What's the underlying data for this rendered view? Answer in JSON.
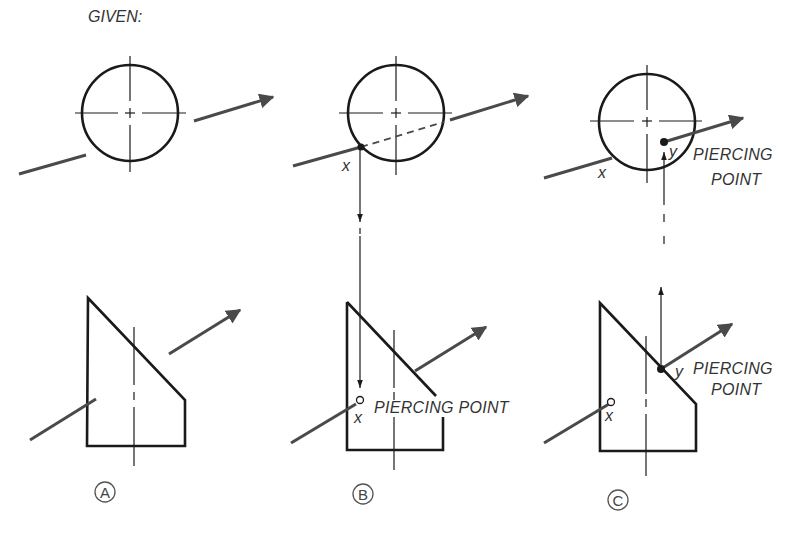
{
  "title": "GIVEN:",
  "panels": [
    {
      "id": "A",
      "label": "A",
      "point_labels": []
    },
    {
      "id": "B",
      "label": "B",
      "point_labels": [
        "x"
      ],
      "annotation": "PIERCING POINT"
    },
    {
      "id": "C",
      "label": "C",
      "point_labels": [
        "x",
        "y"
      ],
      "annotation_top_line1": "PIERCING",
      "annotation_top_line2": "POINT",
      "annotation_bottom_line1": "PIERCING",
      "annotation_bottom_line2": "POINT"
    }
  ],
  "labels": {
    "x": "x",
    "y": "y",
    "piercing": "PIERCING",
    "point": "POINT",
    "piercing_point": "PIERCING POINT"
  },
  "colors": {
    "outline": "#1a1a1a",
    "line": "#4a4a4a",
    "text": "#333333",
    "background": "#ffffff"
  }
}
